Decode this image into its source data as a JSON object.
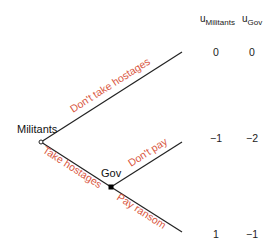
{
  "header": {
    "u1_base": "u",
    "u1_sub": "Militants",
    "u2_base": "u",
    "u2_sub": "Gov"
  },
  "nodes": {
    "militants": "Militants",
    "gov": "Gov"
  },
  "actions": {
    "dont_take": "Don't take hostages",
    "take": "Take hostages",
    "dont_pay": "Don't pay",
    "pay": "Pay ransom"
  },
  "payoffs": [
    {
      "militants": "0",
      "gov": "0"
    },
    {
      "militants": "−1",
      "gov": "−2"
    },
    {
      "militants": "1",
      "gov": "−1"
    }
  ],
  "colors": {
    "action": "#d9573f",
    "line": "#222222"
  }
}
